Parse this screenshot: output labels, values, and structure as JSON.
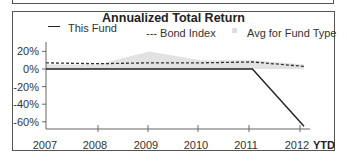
{
  "chart_data": {
    "type": "line",
    "title": "Annualized Total Return",
    "xlabel": "",
    "ylabel": "",
    "categories": [
      "2007",
      "2008",
      "2009",
      "2010",
      "2011",
      "2012"
    ],
    "x_suffix_label": "YTD",
    "yticks": [
      "20%",
      "0%",
      "-20%",
      "-40%",
      "-60%"
    ],
    "ylim": [
      -65,
      25
    ],
    "grid": false,
    "legend_position": "top",
    "series": [
      {
        "name": "This Fund",
        "style": "solid",
        "values": [
          0,
          0,
          0,
          0,
          0,
          -65
        ]
      },
      {
        "name": "Bond Index",
        "style": "dashed",
        "values": [
          7,
          6,
          7,
          7,
          8,
          3
        ]
      },
      {
        "name": "Avg for Fund Type",
        "style": "area",
        "values": [
          5,
          5,
          20,
          10,
          10,
          5
        ]
      }
    ]
  },
  "legend": {
    "fund": "This Fund",
    "bond": "--- Bond Index",
    "avg": "Avg for Fund Type"
  }
}
